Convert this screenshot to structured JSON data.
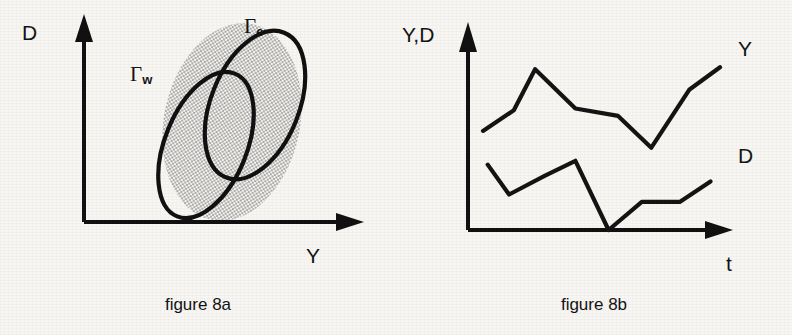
{
  "figure_a": {
    "caption": "figure 8a",
    "y_axis_label": "D",
    "x_axis_label": "Y",
    "region_outer_label": "Γ",
    "region_outer_sub": "e",
    "region_inner_label": "Γ",
    "region_inner_sub": "w",
    "ink_color": "#141414",
    "stipple_color": "#9a9a9a"
  },
  "figure_b": {
    "caption": "figure 8b",
    "y_axis_label": "Y,D",
    "x_axis_label": "t",
    "series_upper_label": "Y",
    "series_lower_label": "D",
    "ink_color": "#141414"
  },
  "chart_data": [
    {
      "type": "scatter",
      "title": "figure 8a",
      "xlabel": "Y",
      "ylabel": "D",
      "grid": false,
      "legend": "inline-annotations",
      "annotations": [
        {
          "text": "Γe",
          "x": 0.8,
          "y": 0.93,
          "describes": "upper-right tilted ellipse region"
        },
        {
          "text": "Γw",
          "x": 0.36,
          "y": 0.73,
          "describes": "lower-left tilted ellipse region"
        }
      ],
      "regions": [
        {
          "name": "Γe",
          "style": "thick outline over stippled fill",
          "center": [
            0.66,
            0.62
          ],
          "rx": 0.155,
          "ry": 0.3,
          "rotation_deg": 20
        },
        {
          "name": "Γw",
          "style": "thick outline over stippled fill",
          "center": [
            0.5,
            0.44
          ],
          "rx": 0.145,
          "ry": 0.295,
          "rotation_deg": 20
        },
        {
          "name": "stipple-backdrop",
          "style": "dotted halftone blob enclosing both regions",
          "center": [
            0.585,
            0.545
          ],
          "rx": 0.245,
          "ry": 0.4,
          "rotation_deg": 12
        }
      ]
    },
    {
      "type": "line",
      "title": "figure 8b",
      "xlabel": "t",
      "ylabel": "Y,D",
      "grid": false,
      "legend": "right-edge series labels",
      "xlim": [
        0,
        1
      ],
      "ylim": [
        0,
        1
      ],
      "series": [
        {
          "name": "Y",
          "x": [
            0.0,
            0.13,
            0.22,
            0.39,
            0.57,
            0.71,
            0.87,
            1.0
          ],
          "values": [
            0.53,
            0.64,
            0.86,
            0.65,
            0.61,
            0.44,
            0.75,
            0.87
          ]
        },
        {
          "name": "D",
          "x": [
            0.02,
            0.11,
            0.26,
            0.39,
            0.53,
            0.67,
            0.83,
            0.96
          ],
          "values": [
            0.35,
            0.19,
            0.29,
            0.37,
            0.0,
            0.15,
            0.15,
            0.26
          ]
        }
      ]
    }
  ]
}
